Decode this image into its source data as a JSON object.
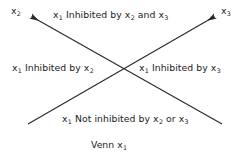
{
  "diagram": {
    "caption": "Venn x1",
    "caption_parts": {
      "word": "Venn",
      "var": "x",
      "sub": "1"
    },
    "background_color": "#ffffff",
    "line_color": "#262626",
    "text_color": "#1a1a1a",
    "axes": [
      {
        "name": "axis-x2",
        "label_var": "x",
        "label_sub": "2",
        "direction": "up-left",
        "has_arrowhead": true,
        "from": [
          222,
          124
        ],
        "to": [
          30,
          16
        ]
      },
      {
        "name": "axis-x3",
        "label_var": "x",
        "label_sub": "3",
        "direction": "up-right",
        "has_arrowhead": true,
        "from": [
          28,
          124
        ],
        "to": [
          216,
          16
        ]
      }
    ],
    "regions": [
      {
        "name": "region-top",
        "position": "top",
        "text": "x1 Inhibited by x2 and x3",
        "segments": [
          {
            "var": "x",
            "sub": "1"
          },
          {
            "word": " Inhibited by "
          },
          {
            "var": "x",
            "sub": "2"
          },
          {
            "word": " and "
          },
          {
            "var": "x",
            "sub": "3"
          }
        ]
      },
      {
        "name": "region-left",
        "position": "left",
        "text": "x1 Inhibited by x2",
        "segments": [
          {
            "var": "x",
            "sub": "1"
          },
          {
            "word": " Inhibited by "
          },
          {
            "var": "x",
            "sub": "2"
          }
        ]
      },
      {
        "name": "region-right",
        "position": "right",
        "text": "x1 Inhibited by x3",
        "segments": [
          {
            "var": "x",
            "sub": "1"
          },
          {
            "word": " Inhibited by "
          },
          {
            "var": "x",
            "sub": "3"
          }
        ]
      },
      {
        "name": "region-bottom",
        "position": "bottom",
        "text": "x1 Not inhibited by x2 or x3",
        "segments": [
          {
            "var": "x",
            "sub": "1"
          },
          {
            "word": " Not inhibited by "
          },
          {
            "var": "x",
            "sub": "2"
          },
          {
            "word": " or "
          },
          {
            "var": "x",
            "sub": "3"
          }
        ]
      }
    ]
  }
}
